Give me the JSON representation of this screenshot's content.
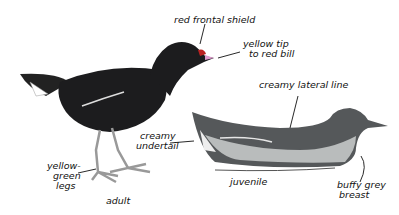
{
  "diagram": {
    "subjects": [
      "adult",
      "juvenile"
    ],
    "labels": {
      "red_frontal_shield": "red frontal shield",
      "yellow_tip_line1": "yellow tip",
      "yellow_tip_line2": "to red bill",
      "creamy_lateral_line": "creamy lateral line",
      "creamy_undertail_line1": "creamy",
      "creamy_undertail_line2": "undertail",
      "legs_line1": "yellow-",
      "legs_line2": "green",
      "legs_line3": "legs",
      "adult": "adult",
      "juvenile": "juvenile",
      "breast_line1": "buffy grey",
      "breast_line2": "breast"
    },
    "colors": {
      "adult_body": "#1c1c1e",
      "juvenile_body": "#55585a",
      "juvenile_belly": "#b9bcbc",
      "background": "#ffffff"
    }
  }
}
